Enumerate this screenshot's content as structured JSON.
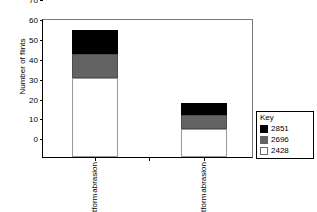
{
  "chart_data": {
    "type": "bar",
    "subtype": "stacked",
    "title": "",
    "xlabel": "",
    "ylabel": "Number of flints",
    "ylim": [
      0,
      70
    ],
    "yticks": [
      0,
      10,
      20,
      30,
      40,
      50,
      60,
      70
    ],
    "grid": false,
    "legend_position": "right",
    "legend_title": "Key",
    "categories": [
      "No platform abrasion",
      "Platform abrasion"
    ],
    "category_lines": [
      [
        "No",
        "platform",
        "abrasion"
      ],
      [
        "Platform",
        "abrasion"
      ]
    ],
    "series": [
      {
        "name": "2428",
        "color": "#ffffff",
        "values": [
          40,
          14
        ]
      },
      {
        "name": "2696",
        "color": "#636363",
        "values": [
          12,
          7
        ]
      },
      {
        "name": "2851",
        "color": "#000000",
        "values": [
          12,
          6
        ]
      }
    ],
    "stack_totals": [
      64,
      27
    ],
    "legend_order": [
      "2851",
      "2696",
      "2428"
    ]
  },
  "axis": {
    "y_tick_labels": [
      "0",
      "10",
      "20",
      "30",
      "40",
      "50",
      "60",
      "70"
    ]
  },
  "legend": {
    "title": "Key",
    "entries": [
      {
        "label": "2851",
        "color": "#000000"
      },
      {
        "label": "2696",
        "color": "#636363"
      },
      {
        "label": "2428",
        "color": "#ffffff"
      }
    ]
  }
}
